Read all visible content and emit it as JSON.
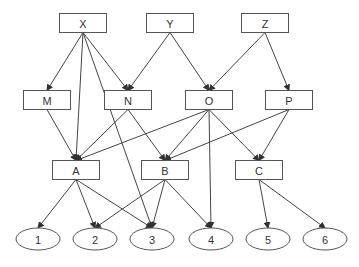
{
  "diagram": {
    "type": "directed-graph",
    "nodes": [
      {
        "id": "X",
        "label": "X",
        "shape": "rect",
        "layer": 0
      },
      {
        "id": "Y",
        "label": "Y",
        "shape": "rect",
        "layer": 0
      },
      {
        "id": "Z",
        "label": "Z",
        "shape": "rect",
        "layer": 0
      },
      {
        "id": "M",
        "label": "M",
        "shape": "rect",
        "layer": 1
      },
      {
        "id": "N",
        "label": "N",
        "shape": "rect",
        "layer": 1
      },
      {
        "id": "O",
        "label": "O",
        "shape": "rect",
        "layer": 1
      },
      {
        "id": "P",
        "label": "P",
        "shape": "rect",
        "layer": 1
      },
      {
        "id": "A",
        "label": "A",
        "shape": "rect",
        "layer": 2
      },
      {
        "id": "B",
        "label": "B",
        "shape": "rect",
        "layer": 2
      },
      {
        "id": "C",
        "label": "C",
        "shape": "rect",
        "layer": 2
      },
      {
        "id": "1",
        "label": "1",
        "shape": "ellipse",
        "layer": 3
      },
      {
        "id": "2",
        "label": "2",
        "shape": "ellipse",
        "layer": 3
      },
      {
        "id": "3",
        "label": "3",
        "shape": "ellipse",
        "layer": 3
      },
      {
        "id": "4",
        "label": "4",
        "shape": "ellipse",
        "layer": 3
      },
      {
        "id": "5",
        "label": "5",
        "shape": "ellipse",
        "layer": 3
      },
      {
        "id": "6",
        "label": "6",
        "shape": "ellipse",
        "layer": 3
      }
    ],
    "edges": [
      {
        "from": "X",
        "to": "M"
      },
      {
        "from": "X",
        "to": "A"
      },
      {
        "from": "X",
        "to": "3"
      },
      {
        "from": "X",
        "to": "N"
      },
      {
        "from": "Y",
        "to": "N"
      },
      {
        "from": "Y",
        "to": "O"
      },
      {
        "from": "Z",
        "to": "O"
      },
      {
        "from": "Z",
        "to": "P"
      },
      {
        "from": "M",
        "to": "A"
      },
      {
        "from": "N",
        "to": "A"
      },
      {
        "from": "N",
        "to": "B"
      },
      {
        "from": "O",
        "to": "A"
      },
      {
        "from": "O",
        "to": "B"
      },
      {
        "from": "O",
        "to": "4"
      },
      {
        "from": "O",
        "to": "C"
      },
      {
        "from": "P",
        "to": "B"
      },
      {
        "from": "P",
        "to": "C"
      },
      {
        "from": "A",
        "to": "1"
      },
      {
        "from": "A",
        "to": "2"
      },
      {
        "from": "A",
        "to": "3"
      },
      {
        "from": "B",
        "to": "2"
      },
      {
        "from": "B",
        "to": "3"
      },
      {
        "from": "B",
        "to": "4"
      },
      {
        "from": "C",
        "to": "5"
      },
      {
        "from": "C",
        "to": "6"
      }
    ]
  }
}
